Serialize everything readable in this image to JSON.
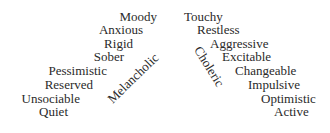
{
  "diagram": {
    "melancholic": {
      "label": "Melancholic",
      "traits": [
        "Moody",
        "Anxious",
        "Rigid",
        "Sober",
        "Pessimistic",
        "Reserved",
        "Unsociable",
        "Quiet"
      ]
    },
    "choleric": {
      "label": "Choleric",
      "traits": [
        "Touchy",
        "Restless",
        "Aggressive",
        "Excitable",
        "Changeable",
        "Impulsive",
        "Optimistic",
        "Active"
      ]
    }
  }
}
